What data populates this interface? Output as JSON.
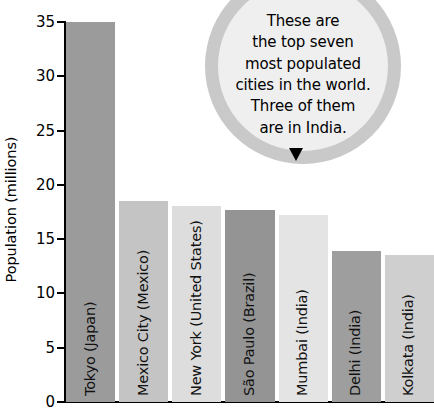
{
  "chart_data": {
    "type": "bar",
    "title": "",
    "subtitle": "",
    "xlabel": "",
    "ylabel": "Population (millions)",
    "ylim": [
      0,
      35
    ],
    "ytick_labels": [
      "35",
      "30",
      "25",
      "20",
      "15",
      "10",
      "5",
      "0"
    ],
    "ytick_values": [
      35,
      30,
      25,
      20,
      15,
      10,
      5,
      0
    ],
    "grid": false,
    "legend": "none",
    "categories": [
      "Tokyo (Japan)",
      "Mexico City (Mexico)",
      "New York (United States)",
      "São Paulo (Brazil)",
      "Mumbai (India)",
      "Delhi (India)",
      "Kolkata (India)"
    ],
    "values": [
      35.0,
      18.5,
      18.1,
      17.7,
      17.2,
      13.9,
      13.5
    ],
    "bar_colors": [
      "#9b9b9b",
      "#c4c4c4",
      "#dddddd",
      "#949494",
      "#e4e4e4",
      "#9e9e9e",
      "#cfcfcf"
    ]
  },
  "annotation": {
    "bubble_text": "These are\nthe top seven\nmost populated\ncities in the world.\nThree of them\nare in India.",
    "bubble_fill": "#efefef",
    "bubble_ring": "#c9c9c9",
    "arrow_color": "#000000"
  }
}
